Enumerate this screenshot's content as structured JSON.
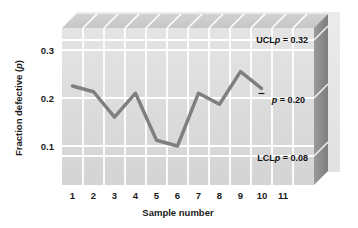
{
  "chart_data": {
    "type": "line",
    "title": "",
    "subtitle": "",
    "xlabel": "Sample number",
    "ylabel": "Fraction defective (p)",
    "ylabel_prefix": "Fraction defective (",
    "ylabel_italic": "p",
    "ylabel_suffix": ")",
    "x": [
      1,
      2,
      3,
      4,
      5,
      6,
      7,
      8,
      9,
      10
    ],
    "values": [
      0.225,
      0.213,
      0.16,
      0.21,
      0.112,
      0.1,
      0.21,
      0.187,
      0.255,
      0.22
    ],
    "series": [
      {
        "name": "Fraction defective",
        "values": [
          0.225,
          0.213,
          0.16,
          0.21,
          0.112,
          0.1,
          0.21,
          0.187,
          0.255,
          0.22
        ]
      }
    ],
    "xticks": [
      "1",
      "2",
      "3",
      "4",
      "5",
      "6",
      "7",
      "8",
      "9",
      "10",
      "11"
    ],
    "xtick_values": [
      1,
      2,
      3,
      4,
      5,
      6,
      7,
      8,
      9,
      10,
      11
    ],
    "yticks": [
      "0.3",
      "0.2",
      "0.1"
    ],
    "ytick_values": [
      0.3,
      0.2,
      0.1
    ],
    "xlim": [
      0.5,
      11.5
    ],
    "ylim": [
      0.0,
      0.355
    ],
    "grid": true,
    "legend_position": "none",
    "control_limits": [
      {
        "id": "ucl",
        "prefix": "UCL",
        "symbol": "p",
        "overbar": false,
        "equals": " = ",
        "value": 0.32,
        "value_text": "0.32",
        "label": "UCLp = 0.32"
      },
      {
        "id": "centerline",
        "prefix": "",
        "symbol": "p",
        "overbar": true,
        "equals": " = ",
        "value": 0.2,
        "value_text": "0.20",
        "label": "p̄ = 0.20"
      },
      {
        "id": "lcl",
        "prefix": "LCL",
        "symbol": "p",
        "overbar": false,
        "equals": " = ",
        "value": 0.08,
        "value_text": "0.08",
        "label": "LCLp = 0.08"
      }
    ],
    "colors": {
      "line": "#7f7f7f",
      "panel_face": "#dcdcdc",
      "panel_slab": "#e6e6e6",
      "panel_top": "#cfcfcf",
      "panel_right_dark": "#8a8a8a",
      "gridline": "#ffffff",
      "background": "#ffffff",
      "text": "#1a1a1a",
      "label_box": "#e3e3e3"
    }
  }
}
